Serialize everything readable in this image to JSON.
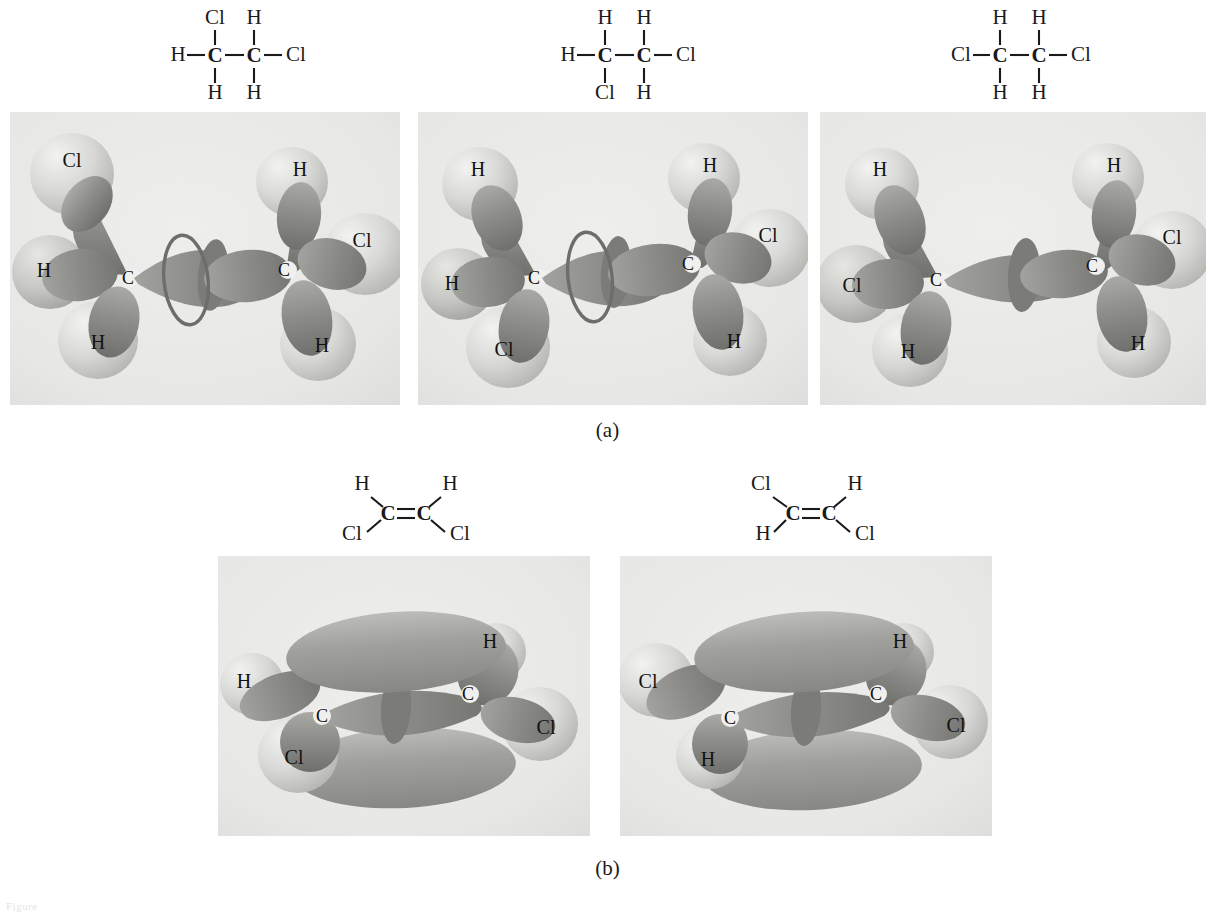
{
  "figure": {
    "part_a_label": "(a)",
    "part_b_label": "(b)",
    "caption_faint": "Figure"
  },
  "atom_labels": {
    "C": "C",
    "H": "H",
    "Cl": "Cl"
  },
  "part_a": {
    "description": "Three conformers of 1,2-dichloroethane shown as hybrid-orbital models with sigma C-C bond",
    "structures": [
      {
        "name": "gauche-conformer-formula",
        "left_carbon": "C",
        "right_carbon": "C",
        "left_top": "Cl",
        "left_side": "H",
        "left_bottom": "H",
        "right_top": "H",
        "right_side": "Cl",
        "right_bottom": "H"
      },
      {
        "name": "anti-clinal-conformer-formula",
        "left_carbon": "C",
        "right_carbon": "C",
        "left_top": "H",
        "left_side": "H",
        "left_bottom": "Cl",
        "right_top": "H",
        "right_side": "Cl",
        "right_bottom": "H"
      },
      {
        "name": "anti-conformer-formula",
        "left_carbon": "C",
        "right_carbon": "C",
        "left_top": "H",
        "left_side": "Cl",
        "left_bottom": "H",
        "right_top": "H",
        "right_side": "Cl",
        "right_bottom": "H"
      }
    ],
    "orbital_panels": [
      {
        "name": "orbital-panel-a1",
        "left_carbon": "C",
        "right_carbon": "C",
        "left_labels": {
          "top": "Cl",
          "mid": "H",
          "bottom": "H"
        },
        "right_labels": {
          "top": "H",
          "mid": "Cl",
          "bottom": "H"
        },
        "has_rotation_ring": true
      },
      {
        "name": "orbital-panel-a2",
        "left_carbon": "C",
        "right_carbon": "C",
        "left_labels": {
          "top": "H",
          "mid": "H",
          "bottom": "Cl"
        },
        "right_labels": {
          "top": "H",
          "mid": "Cl",
          "bottom": "H"
        },
        "has_rotation_ring": true
      },
      {
        "name": "orbital-panel-a3",
        "left_carbon": "C",
        "right_carbon": "C",
        "left_labels": {
          "top": "H",
          "mid": "Cl",
          "bottom": "H"
        },
        "right_labels": {
          "top": "H",
          "mid": "Cl",
          "bottom": "H"
        },
        "has_rotation_ring": false
      }
    ]
  },
  "part_b": {
    "description": "Cis and trans 1,2-dichloroethene shown with sigma frame and pi orbital lobes above and below the plane",
    "structures": [
      {
        "name": "cis-dichloroethene-formula",
        "left_carbon": "C",
        "right_carbon": "C",
        "left_top": "H",
        "left_bottom": "Cl",
        "right_top": "H",
        "right_bottom": "Cl",
        "bond": "double"
      },
      {
        "name": "trans-dichloroethene-formula",
        "left_carbon": "C",
        "right_carbon": "C",
        "left_top": "Cl",
        "left_bottom": "H",
        "right_top": "H",
        "right_bottom": "Cl",
        "bond": "double"
      }
    ],
    "orbital_panels": [
      {
        "name": "orbital-panel-b1",
        "left_carbon": "C",
        "right_carbon": "C",
        "left_labels": {
          "top": "H",
          "bottom": "Cl"
        },
        "right_labels": {
          "top": "H",
          "bottom": "Cl"
        },
        "has_pi_lobes": true
      },
      {
        "name": "orbital-panel-b2",
        "left_carbon": "C",
        "right_carbon": "C",
        "left_labels": {
          "top": "Cl",
          "bottom": "H"
        },
        "right_labels": {
          "top": "H",
          "bottom": "Cl"
        },
        "has_pi_lobes": true
      }
    ]
  },
  "colors": {
    "panel_background": "#e9e9e7",
    "orbital_dark": "#8a8a8a",
    "orbital_light": "#c9c9c7",
    "sphere_light": "#d6d6d4",
    "text": "#1a1a1a"
  }
}
